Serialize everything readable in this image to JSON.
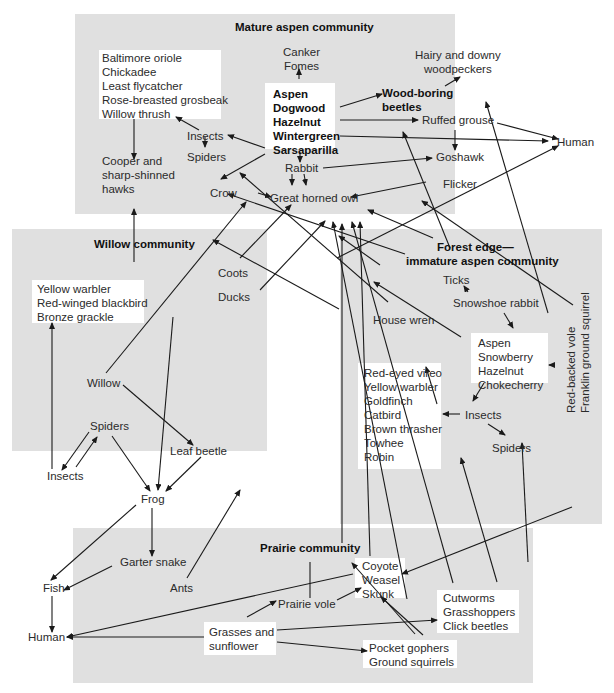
{
  "communities": {
    "mature_aspen": {
      "title": "Mature aspen community"
    },
    "willow": {
      "title": "Willow community"
    },
    "forest_edge": {
      "title_line1": "Forest edge—",
      "title_line2": "immature aspen community"
    },
    "prairie": {
      "title": "Prairie community"
    }
  },
  "nodes": {
    "birds_mature": [
      "Baltimore oriole",
      "Chickadee",
      "Least flycatcher",
      "Rose-breasted grosbeak",
      "Willow thrush"
    ],
    "canker": [
      "Canker",
      "Fomes"
    ],
    "hairy_downy": [
      "Hairy and downy",
      "woodpeckers"
    ],
    "plants_mature": [
      "Aspen",
      "Dogwood",
      "Hazelnut",
      "Wintergreen",
      "Sarsaparilla"
    ],
    "wood_boring": [
      "Wood-boring",
      "beetles"
    ],
    "insects_mature": "Insects",
    "spiders_mature": "Spiders",
    "ruffed_grouse": "Ruffed grouse",
    "human_right": "Human",
    "cooper_hawks": [
      "Cooper and",
      "sharp-shinned",
      "hawks"
    ],
    "rabbit": "Rabbit",
    "goshawk": "Goshawk",
    "crow": "Crow",
    "great_horned_owl": "Great horned owl",
    "flicker": "Flicker",
    "birds_willow": [
      "Yellow warbler",
      "Red-winged blackbird",
      "Bronze grackle"
    ],
    "coots": "Coots",
    "ducks": "Ducks",
    "willow": "Willow",
    "spiders_willow": "Spiders",
    "leaf_beetle": "Leaf beetle",
    "insects_willow": "Insects",
    "frog": "Frog",
    "ticks": "Ticks",
    "snowshoe_rabbit": "Snowshoe rabbit",
    "house_wren": "House wren",
    "plants_edge": [
      "Aspen",
      "Snowberry",
      "Hazelnut",
      "Chokecherry"
    ],
    "voles_squirrel": [
      "Red-backed vole",
      "Franklin ground squirrel"
    ],
    "birds_edge": [
      "Red-eyed vireo",
      "Yellow warbler",
      "Goldfinch",
      "Catbird",
      "Brown thrasher",
      "Towhee",
      "Robin"
    ],
    "insects_edge": "Insects",
    "spiders_edge": "Spiders",
    "garter_snake": "Garter snake",
    "fish": "Fish",
    "ants": "Ants",
    "human_left": "Human",
    "predators_prairie": [
      "Coyote",
      "Weasel",
      "Skunk"
    ],
    "prairie_vole": "Prairie vole",
    "insects_prairie": [
      "Cutworms",
      "Grasshoppers",
      "Click beetles"
    ],
    "grasses": [
      "Grasses and",
      "sunflower"
    ],
    "gophers": [
      "Pocket gophers",
      "Ground squirrels"
    ]
  },
  "colors": {
    "panel": "#e0e0e0",
    "box": "#ffffff",
    "line": "#1a1a1a",
    "text": "#2b2b2b"
  }
}
